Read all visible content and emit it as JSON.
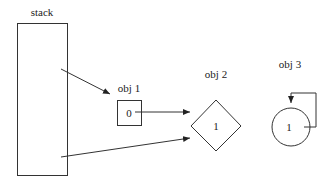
{
  "diagram": {
    "stack": {
      "label": "stack"
    },
    "objects": [
      {
        "id": "obj1",
        "label": "obj 1",
        "shape": "square",
        "value": "0"
      },
      {
        "id": "obj2",
        "label": "obj 2",
        "shape": "diamond",
        "value": "1"
      },
      {
        "id": "obj3",
        "label": "obj 3",
        "shape": "circle",
        "value": "1"
      }
    ],
    "edges": [
      {
        "from": "stack",
        "to": "obj1"
      },
      {
        "from": "stack",
        "to": "obj2"
      },
      {
        "from": "obj1",
        "to": "obj2"
      },
      {
        "from": "obj3",
        "to": "obj3"
      }
    ],
    "colors": {
      "stroke": "#333333",
      "background": "#ffffff"
    }
  }
}
